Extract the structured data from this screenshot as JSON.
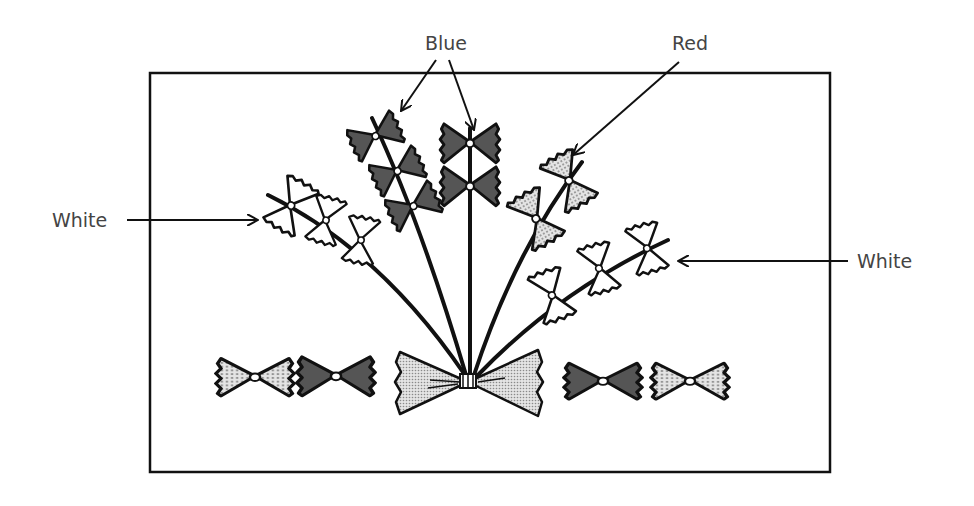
{
  "figure": {
    "colors": {
      "blue_fill": "#555555",
      "red_fill": "#d0d0d0",
      "white_fill": "#ffffff",
      "outline": "#111111",
      "label_text": "#444444"
    }
  },
  "labels": {
    "blue": "Blue",
    "red": "Red",
    "white_left": "White",
    "white_right": "White"
  },
  "stems": [
    {
      "name": "white-left-stem",
      "color": "White",
      "bows": 3
    },
    {
      "name": "blue-left-stem",
      "color": "Blue",
      "bows": 3
    },
    {
      "name": "blue-center-stem",
      "color": "Blue",
      "bows": 2
    },
    {
      "name": "red-stem",
      "color": "Red",
      "bows": 2
    },
    {
      "name": "white-right-stem",
      "color": "White",
      "bows": 3
    }
  ],
  "bottom_row": [
    {
      "name": "loose-bow-1",
      "color": "Red"
    },
    {
      "name": "loose-bow-2",
      "color": "Blue"
    },
    {
      "name": "tie-bow",
      "color": "Red"
    },
    {
      "name": "loose-bow-3",
      "color": "Blue"
    },
    {
      "name": "loose-bow-4",
      "color": "Red"
    }
  ]
}
